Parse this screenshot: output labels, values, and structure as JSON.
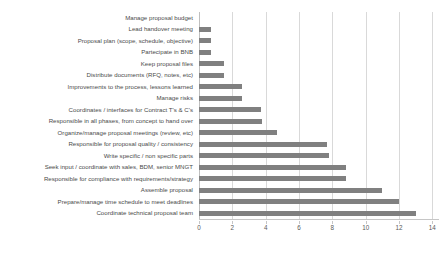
{
  "chart_data": {
    "type": "bar",
    "orientation": "horizontal",
    "title": "",
    "subtitle": "",
    "xlabel": "",
    "ylabel": "",
    "xlim": [
      0,
      14.4
    ],
    "grid": true,
    "legend": false,
    "legend_position": "none",
    "bar_color": "#808080",
    "gridline_color": "#d9d9d9",
    "axis_color": "#c6c6c6",
    "label_color": "#4a4a4a",
    "xticks": [
      0,
      2,
      4,
      6,
      8,
      10,
      12,
      14
    ],
    "xticklabels": [
      "0",
      "2",
      "4",
      "6",
      "8",
      "10",
      "12",
      "14"
    ],
    "categories": [
      "Manage proposal budget",
      "Lead handover meeting",
      "Proposal plan (scope, schedule, objective)",
      "Partecipate in BNB",
      "Keep proposal files",
      "Distribute documents (RFQ, notes, etc)",
      "Improvements to the process, lessons  learned",
      "Manage risks",
      "Coordinates / interfaces for Contract T's & C's",
      "Responsible in all phases, from concept to hand over",
      "Organize/manage proposal meetings (review, etc)",
      "Responsible for proposal quality / consistency",
      "Write specific / non specific parts",
      "Seek input / coordinate with sales, BDM, senior MNGT",
      "Responsible for compliance with  requirements/strategy",
      "Assemble proposal",
      "Prepare/manage time schedule to meet deadlines",
      "Coordinate technical proposal team"
    ],
    "values": [
      0,
      0.7,
      0.7,
      0.7,
      1.5,
      1.5,
      2.6,
      2.6,
      3.7,
      3.8,
      4.7,
      7.7,
      7.8,
      8.8,
      8.8,
      11,
      12,
      13
    ]
  }
}
